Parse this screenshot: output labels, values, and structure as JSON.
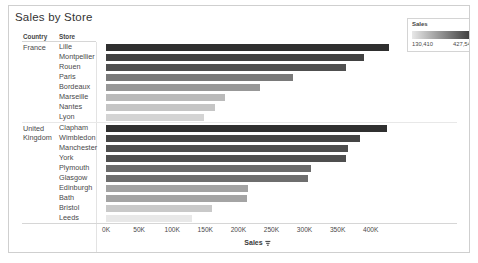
{
  "title": "Sales by Store",
  "headers": {
    "country": "Country",
    "store": "Store"
  },
  "axis": {
    "title": "Sales",
    "sort_icon": "sort-descending-icon",
    "ticks": [
      "0K",
      "50K",
      "100K",
      "150K",
      "200K",
      "250K",
      "300K",
      "350K",
      "400K"
    ]
  },
  "legend": {
    "title": "Sales",
    "min": "130,410",
    "max": "427,549",
    "color_low": "#e8e8e8",
    "color_high": "#2f2f2f"
  },
  "groups": [
    {
      "country": "France",
      "country_lines": [
        "France"
      ]
    },
    {
      "country": "United Kingdom",
      "country_lines": [
        "United",
        "Kingdom"
      ]
    }
  ],
  "chart_data": {
    "type": "bar",
    "title": "Sales by Store",
    "xlabel": "Sales",
    "ylabel": "",
    "orientation": "horizontal",
    "xlim": [
      0,
      440000
    ],
    "grid": false,
    "legend_position": "top-right",
    "color_encoding": "Sales",
    "color_scale": {
      "min": 130410,
      "max": 427549,
      "low": "#e8e8e8",
      "high": "#2f2f2f"
    },
    "tick_values": [
      0,
      50000,
      100000,
      150000,
      200000,
      250000,
      300000,
      350000,
      400000
    ],
    "tick_labels": [
      "0K",
      "50K",
      "100K",
      "150K",
      "200K",
      "250K",
      "300K",
      "350K",
      "400K"
    ],
    "categories": [
      "Lille",
      "Montpellier",
      "Rouen",
      "Paris",
      "Bordeaux",
      "Marseille",
      "Nantes",
      "Lyon",
      "Clapham",
      "Wimbledon",
      "Manchester",
      "York",
      "Plymouth",
      "Glasgow",
      "Edinburgh",
      "Bath",
      "Bristol",
      "Leeds"
    ],
    "values": [
      427549,
      390000,
      362000,
      283000,
      232000,
      180000,
      165000,
      148000,
      425000,
      384000,
      366000,
      363000,
      310000,
      305000,
      215000,
      213000,
      160000,
      130410
    ],
    "series": [
      {
        "name": "France",
        "rows": [
          {
            "store": "Lille",
            "value": 427549
          },
          {
            "store": "Montpellier",
            "value": 390000
          },
          {
            "store": "Rouen",
            "value": 362000
          },
          {
            "store": "Paris",
            "value": 283000
          },
          {
            "store": "Bordeaux",
            "value": 232000
          },
          {
            "store": "Marseille",
            "value": 180000
          },
          {
            "store": "Nantes",
            "value": 165000
          },
          {
            "store": "Lyon",
            "value": 148000
          }
        ]
      },
      {
        "name": "United Kingdom",
        "rows": [
          {
            "store": "Clapham",
            "value": 425000
          },
          {
            "store": "Wimbledon",
            "value": 384000
          },
          {
            "store": "Manchester",
            "value": 366000
          },
          {
            "store": "York",
            "value": 363000
          },
          {
            "store": "Plymouth",
            "value": 310000
          },
          {
            "store": "Glasgow",
            "value": 305000
          },
          {
            "store": "Edinburgh",
            "value": 215000
          },
          {
            "store": "Bath",
            "value": 213000
          },
          {
            "store": "Bristol",
            "value": 160000
          },
          {
            "store": "Leeds",
            "value": 130410
          }
        ]
      }
    ]
  }
}
